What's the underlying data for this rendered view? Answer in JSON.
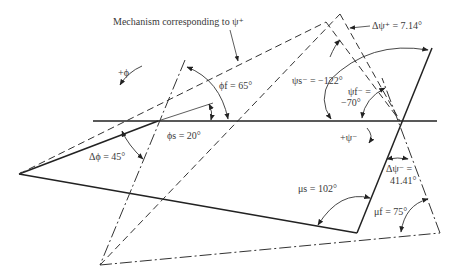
{
  "diagram": {
    "title_label": "Mechanism corresponding to ψ⁺",
    "labels": {
      "plus_phi": "+ϕ",
      "phi_f": "ϕf = 65°",
      "phi_s": "ϕs = 20°",
      "delta_phi": "Δϕ = 45°",
      "delta_psi_plus": "Δψ⁺ = 7.14°",
      "psi_s_minus": "ψs⁻ = −122°",
      "psi_f_minus_line1": "ψf⁻ =",
      "psi_f_minus_line2": "−70°",
      "plus_psi_minus": "+ψ⁻",
      "delta_psi_minus_line1": "Δψ⁻ =",
      "delta_psi_minus_line2": "41.41°",
      "mu_s": "μs = 102°",
      "mu_f": "μf = 75°"
    },
    "legend": {
      "solid": "Starting position",
      "dash_dot": "Final position",
      "dashed": "Mechanism corresponding to ψ⁺"
    },
    "colors": {
      "line": "#222222",
      "text": "#3a3a3a",
      "background": "#ffffff"
    }
  }
}
